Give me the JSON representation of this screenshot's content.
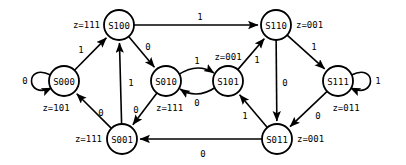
{
  "diagram": {
    "type": "finite-state-machine",
    "title": "",
    "style": {
      "stroke_color": "#000000",
      "fill_color": "#ffffff",
      "background": "#ffffff",
      "node_radius": 15
    },
    "states": [
      {
        "id": "S000",
        "label": "S000",
        "output": "z=101",
        "cx": 64,
        "cy": 81,
        "output_x": 56,
        "output_y": 108,
        "output_anchor": "anchor-middle"
      },
      {
        "id": "S100",
        "label": "S100",
        "output": "z=111",
        "cx": 119,
        "cy": 25,
        "output_x": 100,
        "output_y": 25,
        "output_anchor": "anchor-end"
      },
      {
        "id": "S010",
        "label": "S010",
        "output": "z=111",
        "cx": 166,
        "cy": 81,
        "output_x": 156,
        "output_y": 108,
        "output_anchor": "anchor-start"
      },
      {
        "id": "S101",
        "label": "S101",
        "output": "z=001",
        "cx": 228,
        "cy": 81,
        "output_x": 228,
        "output_y": 57,
        "output_anchor": "anchor-middle"
      },
      {
        "id": "S110",
        "label": "S110",
        "output": "z=001",
        "cx": 276,
        "cy": 25,
        "output_x": 296,
        "output_y": 25,
        "output_anchor": "anchor-start"
      },
      {
        "id": "S111",
        "label": "S111",
        "output": "z=011",
        "cx": 338,
        "cy": 81,
        "output_x": 346,
        "output_y": 108,
        "output_anchor": "anchor-middle"
      },
      {
        "id": "S001",
        "label": "S001",
        "output": "z=111",
        "cx": 122,
        "cy": 139,
        "output_x": 102,
        "output_y": 139,
        "output_anchor": "anchor-end"
      },
      {
        "id": "S011",
        "label": "S011",
        "output": "z=001",
        "cx": 277,
        "cy": 139,
        "output_x": 297,
        "output_y": 139,
        "output_anchor": "anchor-start"
      }
    ],
    "transitions": [
      {
        "from": "S000",
        "to": "S000",
        "input": "0",
        "kind": "self-loop-left",
        "label_x": 25,
        "label_y": 81
      },
      {
        "from": "S000",
        "to": "S100",
        "input": "1",
        "kind": "line",
        "label_x": 81,
        "label_y": 50
      },
      {
        "from": "S100",
        "to": "S110",
        "input": "1",
        "kind": "line",
        "label_x": 200,
        "label_y": 17
      },
      {
        "from": "S100",
        "to": "S010",
        "input": "0",
        "kind": "line",
        "label_x": 148,
        "label_y": 47
      },
      {
        "from": "S010",
        "to": "S101",
        "input": "1",
        "kind": "arc-top",
        "label_x": 197,
        "label_y": 61
      },
      {
        "from": "S101",
        "to": "S010",
        "input": "0",
        "kind": "arc-bottom",
        "label_x": 197,
        "label_y": 103
      },
      {
        "from": "S101",
        "to": "S110",
        "input": "1",
        "kind": "line",
        "label_x": 257,
        "label_y": 60
      },
      {
        "from": "S110",
        "to": "S111",
        "input": "1",
        "kind": "line",
        "label_x": 314,
        "label_y": 47
      },
      {
        "from": "S110",
        "to": "S011",
        "input": "0",
        "kind": "line",
        "label_x": 285,
        "label_y": 83
      },
      {
        "from": "S111",
        "to": "S111",
        "input": "1",
        "kind": "self-loop-right",
        "label_x": 378,
        "label_y": 81
      },
      {
        "from": "S111",
        "to": "S011",
        "input": "0",
        "kind": "line",
        "label_x": 318,
        "label_y": 116
      },
      {
        "from": "S011",
        "to": "S101",
        "input": "1",
        "kind": "line",
        "label_x": 245,
        "label_y": 116
      },
      {
        "from": "S011",
        "to": "S001",
        "input": "0",
        "kind": "line",
        "label_x": 203,
        "label_y": 154
      },
      {
        "from": "S010",
        "to": "S001",
        "input": "0",
        "kind": "line",
        "label_x": 136,
        "label_y": 110
      },
      {
        "from": "S001",
        "to": "S100",
        "input": "1",
        "kind": "line",
        "label_x": 131,
        "label_y": 83
      },
      {
        "from": "S001",
        "to": "S000",
        "input": "0",
        "kind": "line",
        "label_x": 101,
        "label_y": 113
      }
    ]
  }
}
